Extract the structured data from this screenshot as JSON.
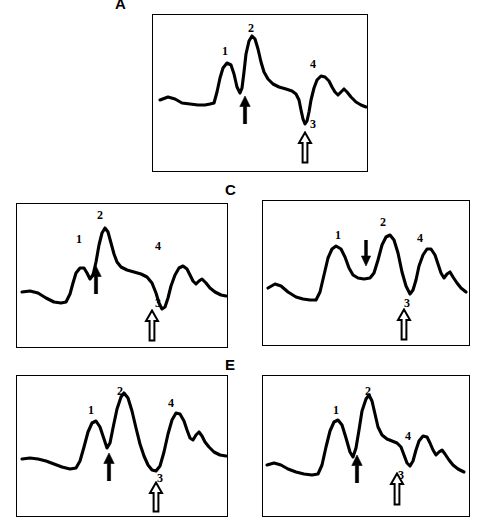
{
  "figure": {
    "type": "multi-panel-spectra-figure",
    "background_color": "#ffffff",
    "ink_color": "#000000",
    "panel_count": 5,
    "description_text": ""
  },
  "chart_data": {
    "type": "line",
    "title": "",
    "xlabel": "",
    "ylabel": "",
    "grid": false,
    "legend": "none",
    "axis_visible": false,
    "shared_peak_labels": [
      "1",
      "2",
      "3",
      "4"
    ],
    "marker_types": {
      "solid_up": "filled upward arrow marking valley between peak 1 and peak 2",
      "open_up": "open outline upward arrow marking valley 3",
      "solid_down": "filled downward arrow marking plateau between peak 1 and peak 2"
    },
    "panels": [
      {
        "id": "A",
        "letter": "A",
        "box": {
          "x": 152,
          "y": 14,
          "w": 216,
          "h": 158
        },
        "peak_labels": [
          {
            "text": "1",
            "x": 222,
            "y": 45
          },
          {
            "text": "2",
            "x": 248,
            "y": 22
          },
          {
            "text": "4",
            "x": 310,
            "y": 58
          },
          {
            "text": "3",
            "x": 310,
            "y": 118
          }
        ],
        "markers": [
          {
            "kind": "solid_up",
            "x": 237,
            "y": 96,
            "h": 28
          },
          {
            "kind": "open_up",
            "x": 297,
            "y": 131,
            "h": 33
          }
        ],
        "path": "M 160,100 L 168,97 L 175,99 L 182,103 L 190,104 L 198,105 L 205,105 L 210,104 L 214,103 L 217,92 L 220,78 L 223,68 L 227,63 L 231,65 L 234,74 L 237,87 L 240,93 L 242,88 L 244,72 L 246,54 L 249,41 L 252,36 L 255,39 L 258,49 L 261,62 L 264,72 L 268,79 L 273,84 L 279,87 L 286,89 L 292,91 L 296,94 L 299,100 L 301,110 L 303,119 L 305,124 L 307,121 L 309,112 L 311,100 L 314,88 L 317,80 L 321,76 L 325,77 L 329,81 L 332,87 L 335,92 L 338,95 L 341,92 L 344,89 L 347,92 L 351,97 L 356,102 L 361,105 L 366,107"
      },
      {
        "id": "B",
        "letter": "B",
        "box": {
          "x": 16,
          "y": 203,
          "w": 212,
          "h": 145
        },
        "peak_labels": [
          {
            "text": "1",
            "x": 76,
            "y": 233
          },
          {
            "text": "2",
            "x": 97,
            "y": 209
          },
          {
            "text": "4",
            "x": 155,
            "y": 240
          },
          {
            "text": "3",
            "x": 155,
            "y": 297
          }
        ],
        "markers": [
          {
            "kind": "solid_up",
            "x": 88,
            "y": 266,
            "h": 28
          },
          {
            "kind": "open_up",
            "x": 144,
            "y": 309,
            "h": 33
          }
        ],
        "path": "M 22,292 L 30,291 L 38,293 L 46,298 L 54,302 L 61,303 L 66,302 L 70,294 L 73,283 L 76,273 L 80,268 L 84,268 L 87,273 L 90,279 L 93,275 L 96,262 L 99,245 L 102,233 L 105,228 L 108,232 L 111,243 L 114,254 L 117,262 L 121,267 L 127,270 L 134,272 L 141,274 L 147,277 L 152,283 L 156,293 L 159,303 L 162,309 L 165,307 L 168,298 L 171,286 L 175,275 L 179,268 L 183,266 L 187,269 L 190,275 L 193,281 L 196,284 L 199,281 L 202,279 L 206,283 L 210,288 L 215,292 L 221,295 L 226,296"
      },
      {
        "id": "C",
        "letter": "C",
        "box": {
          "x": 262,
          "y": 200,
          "w": 208,
          "h": 146
        },
        "peak_labels": [
          {
            "text": "1",
            "x": 335,
            "y": 229
          },
          {
            "text": "2",
            "x": 380,
            "y": 216
          },
          {
            "text": "4",
            "x": 417,
            "y": 232
          },
          {
            "text": "3",
            "x": 404,
            "y": 297
          }
        ],
        "markers": [
          {
            "kind": "solid_down",
            "x": 358,
            "y": 240,
            "h": 26
          },
          {
            "kind": "open_up",
            "x": 396,
            "y": 308,
            "h": 33
          }
        ],
        "path": "M 268,288 L 275,284 L 281,286 L 288,292 L 296,297 L 303,299 L 310,300 L 316,300 L 320,292 L 324,275 L 328,258 L 332,249 L 336,246 L 341,249 L 345,257 L 349,268 L 353,275 L 358,278 L 364,279 L 370,278 L 374,273 L 378,260 L 382,245 L 386,237 L 390,235 L 394,240 L 398,253 L 402,272 L 406,286 L 410,294 L 413,290 L 416,280 L 419,266 L 423,255 L 427,249 L 431,249 L 435,255 L 438,264 L 441,273 L 444,278 L 447,274 L 450,272 L 453,277 L 457,283 L 461,288 L 466,292"
      },
      {
        "id": "D",
        "letter": "D",
        "box": {
          "x": 16,
          "y": 375,
          "w": 212,
          "h": 142
        },
        "peak_labels": [
          {
            "text": "1",
            "x": 88,
            "y": 404
          },
          {
            "text": "2",
            "x": 117,
            "y": 385
          },
          {
            "text": "4",
            "x": 168,
            "y": 397
          },
          {
            "text": "3",
            "x": 157,
            "y": 472
          },
          {
            "text": "",
            "x": 0,
            "y": 0
          }
        ],
        "markers": [
          {
            "kind": "solid_up",
            "x": 101,
            "y": 453,
            "h": 28
          },
          {
            "kind": "open_up",
            "x": 148,
            "y": 481,
            "h": 32
          }
        ],
        "path": "M 22,459 L 30,458 L 38,459 L 46,461 L 54,464 L 62,467 L 70,469 L 76,468 L 80,461 L 84,447 L 88,432 L 92,423 L 96,421 L 100,427 L 104,439 L 107,448 L 110,443 L 113,428 L 117,409 L 121,397 L 124,393 L 128,398 L 132,411 L 136,428 L 140,444 L 144,456 L 148,465 L 152,470 L 156,471 L 160,466 L 164,452 L 168,434 L 172,420 L 176,413 L 180,414 L 184,421 L 187,430 L 190,438 L 193,440 L 196,435 L 199,432 L 202,436 L 205,442 L 209,447 L 214,452 L 220,455 L 226,456"
      },
      {
        "id": "E",
        "letter": "E",
        "box": {
          "x": 262,
          "y": 375,
          "w": 208,
          "h": 142
        },
        "peak_labels": [
          {
            "text": "1",
            "x": 333,
            "y": 404
          },
          {
            "text": "2",
            "x": 365,
            "y": 385
          },
          {
            "text": "4",
            "x": 405,
            "y": 430
          },
          {
            "text": "3",
            "x": 398,
            "y": 469
          }
        ],
        "markers": [
          {
            "kind": "solid_up",
            "x": 349,
            "y": 455,
            "h": 28
          },
          {
            "kind": "open_up",
            "x": 389,
            "y": 472,
            "h": 34
          }
        ],
        "path": "M 267,465 L 274,463 L 281,465 L 288,469 L 296,472 L 304,474 L 312,475 L 318,474 L 322,465 L 326,447 L 330,431 L 334,422 L 338,420 L 342,425 L 346,438 L 350,452 L 353,457 L 356,448 L 359,430 L 362,411 L 366,399 L 369,395 L 372,401 L 375,414 L 378,427 L 382,435 L 387,439 L 392,441 L 397,443 L 401,447 L 404,455 L 407,463 L 410,466 L 413,461 L 416,450 L 419,441 L 423,436 L 427,437 L 430,443 L 433,450 L 436,455 L 439,452 L 442,450 L 445,454 L 449,460 L 453,465 L 458,469 L 464,472"
      }
    ]
  }
}
